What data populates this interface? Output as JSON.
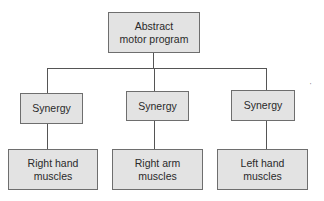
{
  "diagram": {
    "root": {
      "label_line1": "Abstract",
      "label_line2": "motor program"
    },
    "synergies": [
      {
        "label": "Synergy"
      },
      {
        "label": "Synergy"
      },
      {
        "label": "Synergy"
      }
    ],
    "effectors": [
      {
        "label_line1": "Right hand",
        "label_line2": "muscles"
      },
      {
        "label_line1": "Right arm",
        "label_line2": "muscles"
      },
      {
        "label_line1": "Left hand",
        "label_line2": "muscles"
      }
    ],
    "stray_mark": "'"
  }
}
